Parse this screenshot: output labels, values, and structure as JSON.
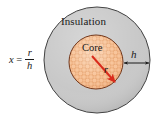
{
  "figure": {
    "background_color": "#ffffff",
    "width": 158,
    "height": 124,
    "formula": {
      "variable": "x",
      "equals": "=",
      "numerator": "r",
      "denominator": "h",
      "full_text": "x = r/h"
    },
    "labels": {
      "insulation": "Insulation",
      "core": "Core",
      "thickness": "h",
      "radius": "r"
    },
    "shapes": {
      "outer_circle": {
        "name": "insulation-region",
        "fill_color": "#c6c6c6",
        "stroke_color": "#3a3a3a",
        "center_x": 97,
        "center_y": 60,
        "radius": 53
      },
      "inner_circle": {
        "name": "core-region",
        "fill_color": "#f7bf91",
        "stroke_color": "#6b3418",
        "center_x": 96,
        "center_y": 62,
        "radius": 27
      },
      "radius_arrow": {
        "name": "radius-arrow",
        "color": "#d92b1c",
        "x1": 93,
        "y1": 57,
        "x2": 114,
        "y2": 81
      },
      "thickness_arrow": {
        "name": "thickness-arrow",
        "color": "#1a1a1a",
        "x1": 124,
        "y1": 63,
        "x2": 149,
        "y2": 63
      }
    }
  }
}
